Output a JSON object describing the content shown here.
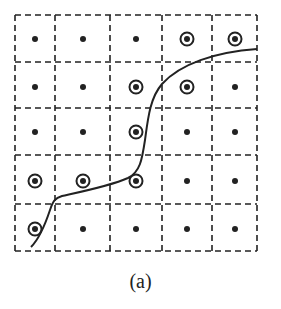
{
  "figure": {
    "caption": "(a)",
    "grid": {
      "rows": 5,
      "cols": 5,
      "x_bounds": [
        15,
        55,
        110,
        162,
        212,
        257
      ],
      "y_bounds": [
        15,
        62,
        108,
        155,
        204,
        251
      ],
      "line_style": "dashed",
      "line_color": "#222222"
    },
    "points": {
      "x": [
        35,
        83,
        136,
        187,
        235
      ],
      "y": [
        39,
        87,
        132,
        181,
        229
      ],
      "circled": [
        [
          false,
          false,
          false,
          true,
          true
        ],
        [
          false,
          false,
          true,
          true,
          false
        ],
        [
          false,
          false,
          true,
          false,
          false
        ],
        [
          true,
          true,
          true,
          false,
          false
        ],
        [
          true,
          false,
          false,
          false,
          false
        ]
      ]
    },
    "curve": {
      "path": "M31,247 C40,238 46,222 50,210 C53,201 55,198 62,196 C80,192 110,186 128,178 C140,172 142,160 145,140 C148,118 150,98 162,84 C180,64 215,52 257,49",
      "color": "#222222"
    }
  }
}
